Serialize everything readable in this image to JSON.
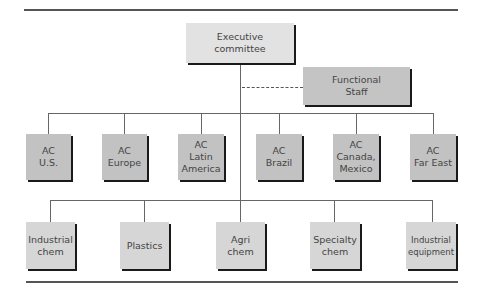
{
  "diagram": {
    "type": "org-chart",
    "top": {
      "label": "Executive\ncommittee"
    },
    "staff": {
      "label": "Functional\nStaff",
      "link": "dashed"
    },
    "area_committees": [
      {
        "label": "AC\nU.S."
      },
      {
        "label": "AC\nEurope"
      },
      {
        "label": "AC\nLatin\nAmerica"
      },
      {
        "label": "AC\nBrazil"
      },
      {
        "label": "AC\nCanada,\nMexico"
      },
      {
        "label": "AC\nFar East"
      }
    ],
    "divisions": [
      {
        "label": "Industrial\nchem"
      },
      {
        "label": "Plastics"
      },
      {
        "label": "Agri\nchem"
      },
      {
        "label": "Specialty\nchem"
      },
      {
        "label": "Industrial\nequipment"
      }
    ]
  },
  "colors": {
    "exec_fill": "#e2e2e2",
    "ac_fill": "#c2c2c2",
    "division_fill": "#d6d6d6",
    "shadow": "#1a1a1a",
    "line": "#666666"
  }
}
